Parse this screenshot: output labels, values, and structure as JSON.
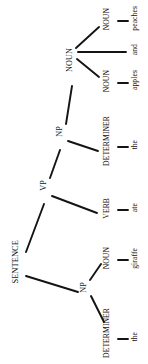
{
  "diagram": {
    "orientation": "rotated-90-ccw",
    "background_color": "#ffffff",
    "line_color": "#141414",
    "text_color": "#111111",
    "sentence_text": "the giraffe ate the apples and peaches",
    "root": {
      "label": "SENTENCE"
    },
    "nodes": {
      "root": "SENTENCE",
      "np_subject": "NP",
      "vp": "VP",
      "np_object": "NP",
      "noun_coord": "NOUN",
      "det_subject": "DETERMINER",
      "noun_subject": "NOUN",
      "verb": "VERB",
      "det_object": "DETERMINER",
      "noun_apples": "NOUN",
      "noun_peaches": "NOUN"
    },
    "words": {
      "the_subject": "the",
      "giraffe": "giraffe",
      "ate": "ate",
      "the_object": "the",
      "apples": "apples",
      "and": "and",
      "peaches": "peaches"
    },
    "leaves": [
      {
        "pos": "NOUN",
        "word": "peaches"
      },
      {
        "pos": "",
        "word": "and"
      },
      {
        "pos": "NOUN",
        "word": "apples"
      },
      {
        "pos": "DETERMINER",
        "word": "the"
      },
      {
        "pos": "VERB",
        "word": "ate"
      },
      {
        "pos": "NOUN",
        "word": "giraffe"
      },
      {
        "pos": "DETERMINER",
        "word": "the"
      }
    ]
  }
}
